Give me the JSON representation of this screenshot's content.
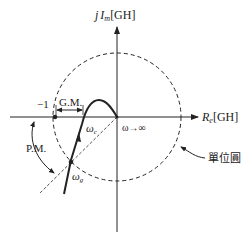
{
  "diagram": {
    "axes": {
      "imag_label_prefix": "j",
      "imag_label_var": "I",
      "imag_label_sub": "m",
      "imag_label_unit": "[GH]",
      "real_label_var": "R",
      "real_label_sub": "e",
      "real_label_unit": "[GH]"
    },
    "labels": {
      "minus_one": "−1",
      "gain_margin": "G.M.",
      "phase_margin": "P.M.",
      "omega_c_var": "ω",
      "omega_c_sub": "c",
      "omega_g_var": "ω",
      "omega_g_sub": "g",
      "omega_inf": "ω→∞",
      "unit_circle": "單位圓"
    },
    "colors": {
      "stroke": "#222222",
      "background": "#ffffff"
    }
  }
}
